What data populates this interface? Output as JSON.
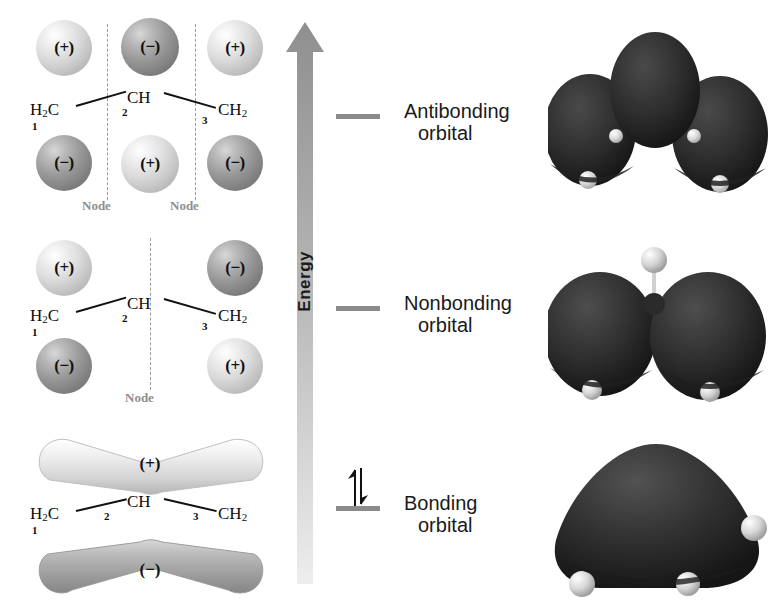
{
  "figure": {
    "energy_axis_label": "Energy",
    "molecule_skeleton": {
      "left_group": "H2C",
      "center_group": "CH",
      "right_group": "CH2",
      "carbon_numbers": [
        "1",
        "2",
        "3"
      ]
    },
    "signs": {
      "positive": "(+)",
      "negative": "(−)"
    },
    "node_label": "Node",
    "colors": {
      "lobe_positive": "#dcdcdc",
      "lobe_negative": "#8a8a8a",
      "node_line": "#9a9a9a",
      "node_text": "#8e8e8e",
      "level_bar": "#8b8b8b",
      "arrow_top": "#8f8f8f",
      "arrow_bottom": "#e8e8e8",
      "label_text": "#1a1a1a",
      "render_lobe": "#2a2a2a",
      "render_hydrogen": "#d8d8d8"
    }
  },
  "levels": [
    {
      "id": "antibonding",
      "label_line1": "Antibonding",
      "label_line2": "orbital",
      "electrons": 0,
      "nodes": 2,
      "node_labels": [
        "Node",
        "Node"
      ],
      "lobes": [
        {
          "carbon": "1",
          "position": "top",
          "sign": "(+)"
        },
        {
          "carbon": "2",
          "position": "top",
          "sign": "(−)"
        },
        {
          "carbon": "3",
          "position": "top",
          "sign": "(+)"
        },
        {
          "carbon": "1",
          "position": "bottom",
          "sign": "(−)"
        },
        {
          "carbon": "2",
          "position": "bottom",
          "sign": "(+)"
        },
        {
          "carbon": "3",
          "position": "bottom",
          "sign": "(−)"
        }
      ]
    },
    {
      "id": "nonbonding",
      "label_line1": "Nonbonding",
      "label_line2": "orbital",
      "electrons": 0,
      "nodes": 1,
      "node_labels": [
        "Node"
      ],
      "lobes": [
        {
          "carbon": "1",
          "position": "top",
          "sign": "(+)"
        },
        {
          "carbon": "3",
          "position": "top",
          "sign": "(−)"
        },
        {
          "carbon": "1",
          "position": "bottom",
          "sign": "(−)"
        },
        {
          "carbon": "3",
          "position": "bottom",
          "sign": "(+)"
        }
      ]
    },
    {
      "id": "bonding",
      "label_line1": "Bonding",
      "label_line2": "orbital",
      "electrons": 2,
      "nodes": 0,
      "node_labels": [],
      "lobes": [
        {
          "carbon": "delocalized",
          "position": "top",
          "sign": "(+)"
        },
        {
          "carbon": "delocalized",
          "position": "bottom",
          "sign": "(−)"
        }
      ]
    }
  ],
  "renders": [
    {
      "id": "antibonding",
      "description": "three separate dark lobes with white hydrogen atoms"
    },
    {
      "id": "nonbonding",
      "description": "two dark lobes separated by a node with central C-H ball and stick"
    },
    {
      "id": "bonding",
      "description": "one continuous delocalized dark lobe with white hydrogen atoms"
    }
  ]
}
